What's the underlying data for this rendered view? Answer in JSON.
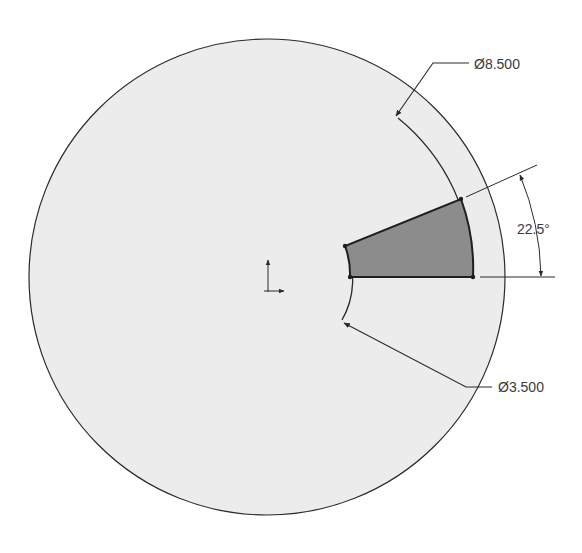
{
  "drawing": {
    "colors": {
      "background": "#ffffff",
      "disc_fill": "#ececec",
      "sector_fill": "#8c8c8c",
      "line": "#2a2a2a"
    },
    "dimensions": {
      "outer_diameter": "Ø8.500",
      "inner_diameter": "Ø3.500",
      "angle": "22.5°"
    },
    "icons": {
      "origin": "origin-axes-icon"
    }
  }
}
